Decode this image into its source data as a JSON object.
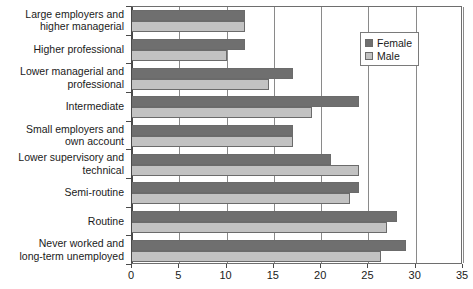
{
  "chart_data": {
    "type": "bar",
    "orientation": "horizontal",
    "title": "",
    "subtitle": "",
    "xlabel": "",
    "ylabel": "",
    "xlim": [
      0,
      35
    ],
    "xticks": [
      "0",
      "5",
      "10",
      "15",
      "20",
      "25",
      "30",
      "35"
    ],
    "xtick_values": [
      0,
      5,
      10,
      15,
      20,
      25,
      30,
      35
    ],
    "grid": true,
    "grid_axis": "x",
    "legend_position": "top-right-inside",
    "categories": [
      "Large employers and\nhigher managerial",
      "Higher professional",
      "Lower managerial and\nprofessional",
      "Intermediate",
      "Small employers and\nown account",
      "Lower supervisory and\ntechnical",
      "Semi-routine",
      "Routine",
      "Never worked and\nlong-term unemployed"
    ],
    "series": [
      {
        "name": "Female",
        "color": "#6f6f6f",
        "values": [
          12,
          12,
          17,
          24,
          17,
          21,
          24,
          28,
          29
        ]
      },
      {
        "name": "Male",
        "color": "#c2c2c2",
        "values": [
          12,
          10,
          14.5,
          19,
          17,
          24,
          23,
          27,
          26.3
        ]
      }
    ]
  },
  "legend": {
    "items": [
      {
        "label": "Female",
        "swatch": "female"
      },
      {
        "label": "Male",
        "swatch": "male"
      }
    ]
  }
}
